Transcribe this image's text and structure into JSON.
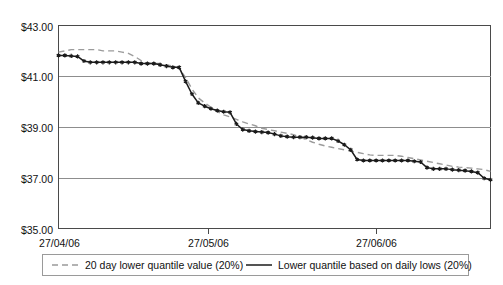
{
  "chart_data": {
    "type": "line",
    "title": "",
    "subtitle": "",
    "xlabel": "",
    "ylabel": "",
    "grid": true,
    "legend_position": "bottom",
    "ylim": [
      35.0,
      43.0
    ],
    "ytick_labels": [
      "$43.00",
      "$41.00",
      "$39.00",
      "$37.00",
      "$35.00"
    ],
    "ytick_values": [
      43.0,
      41.0,
      39.0,
      37.0,
      35.0
    ],
    "xtick_labels": [
      "27/04/06",
      "27/05/06",
      "27/06/06"
    ],
    "xtick_positions": [
      0,
      47,
      100
    ],
    "xlim": [
      0,
      136
    ],
    "series": [
      {
        "name": "20 day lower quantile value (20%)",
        "style": "dashed",
        "color": "#9b9b9b",
        "marker": "none",
        "x": [
          0,
          2,
          4,
          6,
          8,
          10,
          12,
          14,
          16,
          18,
          20,
          22,
          24,
          26,
          28,
          30,
          32,
          34,
          36,
          38,
          40,
          42,
          44,
          46,
          48,
          50,
          52,
          54,
          56,
          58,
          60,
          62,
          64,
          66,
          68,
          70,
          72,
          74,
          76,
          78,
          80,
          82,
          84,
          86,
          88,
          90,
          92,
          94,
          96,
          98,
          100,
          102,
          104,
          106,
          108,
          110,
          112,
          114,
          116,
          118,
          120,
          122,
          124,
          126,
          128,
          130,
          132,
          134,
          136
        ],
        "values": [
          41.95,
          42.0,
          42.05,
          42.05,
          42.05,
          42.05,
          42.05,
          42.0,
          42.0,
          42.0,
          41.95,
          41.9,
          41.78,
          41.62,
          41.5,
          41.5,
          41.5,
          41.45,
          41.4,
          41.3,
          40.95,
          40.5,
          40.15,
          39.95,
          39.78,
          39.6,
          39.48,
          39.4,
          39.3,
          39.2,
          39.12,
          39.05,
          38.95,
          38.9,
          38.85,
          38.8,
          38.75,
          38.7,
          38.6,
          38.5,
          38.4,
          38.32,
          38.25,
          38.2,
          38.15,
          38.1,
          38.05,
          38.0,
          37.95,
          37.9,
          37.88,
          37.88,
          37.88,
          37.88,
          37.85,
          37.8,
          37.75,
          37.7,
          37.65,
          37.6,
          37.55,
          37.5,
          37.45,
          37.42,
          37.4,
          37.38,
          37.35,
          37.32,
          37.25
        ]
      },
      {
        "name": "Lower quantile  based on daily lows (20%)",
        "style": "solid",
        "color": "#1b1b1b",
        "marker": "star",
        "x": [
          0,
          2,
          4,
          6,
          8,
          10,
          12,
          14,
          16,
          18,
          20,
          22,
          24,
          26,
          28,
          30,
          32,
          34,
          36,
          38,
          40,
          42,
          44,
          46,
          48,
          50,
          52,
          54,
          56,
          58,
          60,
          62,
          64,
          66,
          68,
          70,
          72,
          74,
          76,
          78,
          80,
          82,
          84,
          86,
          88,
          90,
          92,
          94,
          96,
          98,
          100,
          102,
          104,
          106,
          108,
          110,
          112,
          114,
          116,
          118,
          120,
          122,
          124,
          126,
          128,
          130,
          132,
          134,
          136
        ],
        "values": [
          41.82,
          41.82,
          41.8,
          41.78,
          41.6,
          41.55,
          41.55,
          41.55,
          41.55,
          41.55,
          41.55,
          41.55,
          41.55,
          41.5,
          41.5,
          41.5,
          41.45,
          41.4,
          41.35,
          41.35,
          40.8,
          40.3,
          39.95,
          39.82,
          39.72,
          39.65,
          39.6,
          39.58,
          39.12,
          38.9,
          38.85,
          38.82,
          38.8,
          38.78,
          38.72,
          38.65,
          38.62,
          38.6,
          38.6,
          38.6,
          38.58,
          38.55,
          38.55,
          38.55,
          38.45,
          38.3,
          38.1,
          37.72,
          37.68,
          37.68,
          37.68,
          37.68,
          37.68,
          37.68,
          37.68,
          37.68,
          37.65,
          37.62,
          37.4,
          37.35,
          37.35,
          37.35,
          37.32,
          37.3,
          37.28,
          37.25,
          37.2,
          36.98,
          36.92
        ]
      }
    ]
  },
  "legend": {
    "entries": [
      {
        "label": "20 day lower quantile value (20%)",
        "style": "dashed"
      },
      {
        "label": "Lower quantile  based on daily lows (20%)",
        "style": "solid-star"
      }
    ]
  }
}
